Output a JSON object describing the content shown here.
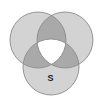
{
  "diagram": {
    "type": "venn-3",
    "colors": {
      "background": "#ffffff",
      "single_region": "#d3d3d3",
      "pair_overlap": "#a9a9a9",
      "triple_overlap": "#ffffff",
      "outline": "#8a8a8a",
      "label": "#222222"
    },
    "circles": [
      {
        "name": "left",
        "cx": 38,
        "cy": 40,
        "r": 28
      },
      {
        "name": "right",
        "cx": 65,
        "cy": 40,
        "r": 28
      },
      {
        "name": "bottom",
        "cx": 51,
        "cy": 67,
        "r": 28
      }
    ],
    "labels": [
      {
        "text": "S",
        "x": 50.5,
        "y": 80.5,
        "region": "bottom-only"
      }
    ]
  }
}
